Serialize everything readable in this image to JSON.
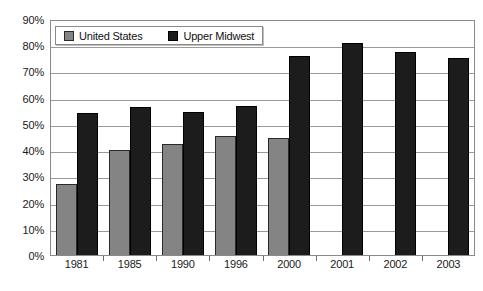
{
  "chart_data": {
    "type": "bar",
    "title": "",
    "subtitle": "",
    "xlabel": "",
    "ylabel": "",
    "ylim": [
      0,
      90
    ],
    "ytick_step": 10,
    "ytick_labels": [
      "90%",
      "80%",
      "70%",
      "60%",
      "50%",
      "40%",
      "30%",
      "20%",
      "10%",
      "0%"
    ],
    "ytick_values": [
      90,
      80,
      70,
      60,
      50,
      40,
      30,
      20,
      10,
      0
    ],
    "grid": true,
    "legend_position": "top-left-inside",
    "categories": [
      "1981",
      "1985",
      "1990",
      "1996",
      "2000",
      "2001",
      "2002",
      "2003"
    ],
    "series": [
      {
        "name": "United States",
        "color": "#848484",
        "values": [
          27,
          40,
          42.5,
          45.5,
          44.5,
          null,
          null,
          null
        ]
      },
      {
        "name": "Upper Midwest",
        "color": "#1c1c1c",
        "values": [
          54,
          56.5,
          54.5,
          57,
          76,
          81,
          77.5,
          75
        ]
      }
    ]
  },
  "legend": {
    "entries": [
      {
        "label": "United States",
        "swatch": "series-us"
      },
      {
        "label": "Upper Midwest",
        "swatch": "series-um"
      }
    ]
  },
  "colors": {
    "series_us": "#848484",
    "series_um": "#1c1c1c",
    "gridline": "#9a9a9a",
    "frame": "#8a8a8a",
    "background": "#ffffff",
    "text": "#1a1a1a"
  }
}
